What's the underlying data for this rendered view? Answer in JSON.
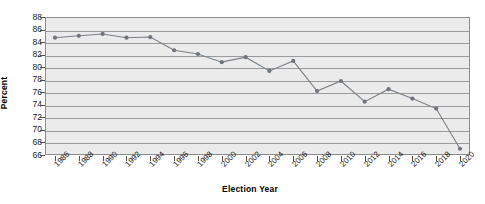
{
  "chart_data": {
    "type": "line",
    "title": "",
    "xlabel": "Election Year",
    "ylabel": "Percent",
    "categories": [
      "1986",
      "1988",
      "1990",
      "1992",
      "1994",
      "1996",
      "1998",
      "2000",
      "2002",
      "2004",
      "2006",
      "2008",
      "2010",
      "2012",
      "2014",
      "2016",
      "2018",
      "2020"
    ],
    "x": [
      1986,
      1988,
      1990,
      1992,
      1994,
      1996,
      1998,
      2000,
      2002,
      2004,
      2006,
      2008,
      2010,
      2012,
      2014,
      2016,
      2018,
      2020
    ],
    "values": [
      84.7,
      85.0,
      85.3,
      84.7,
      84.8,
      82.7,
      82.1,
      80.8,
      81.6,
      79.4,
      81.0,
      76.2,
      77.8,
      74.5,
      76.5,
      75.0,
      73.4,
      67.0
    ],
    "series": [
      {
        "name": "Percent",
        "values": [
          84.7,
          85.0,
          85.3,
          84.7,
          84.8,
          82.7,
          82.1,
          80.8,
          81.6,
          79.4,
          81.0,
          76.2,
          77.8,
          74.5,
          76.5,
          75.0,
          73.4,
          67.0
        ]
      }
    ],
    "ylim": [
      66,
      88
    ],
    "xlim": [
      1986,
      2020
    ],
    "ytick_labels": [
      "88",
      "86",
      "84",
      "82",
      "80",
      "78",
      "76",
      "74",
      "72",
      "70",
      "68",
      "66"
    ],
    "ytick_values": [
      88,
      86,
      84,
      82,
      80,
      78,
      76,
      74,
      72,
      70,
      68,
      66
    ],
    "ytick_step": 2,
    "xtick_labels": [
      "1986",
      "1988",
      "1990",
      "1992",
      "1994",
      "1996",
      "1998",
      "2000",
      "2002",
      "2004",
      "2006",
      "2008",
      "2010",
      "2012",
      "2014",
      "2016",
      "2018",
      "2020"
    ],
    "grid": "horizontal",
    "legend": "none",
    "legend_position": "none",
    "marker": "circle",
    "colors": {
      "line": "#7a7f86",
      "marker": "#6f757c",
      "plot_background": "#ebebeb",
      "gridline": "#9a9a9a",
      "frame": "#8c8c8c",
      "text": "#1a1a1a",
      "page_background": "#ffffff"
    }
  }
}
